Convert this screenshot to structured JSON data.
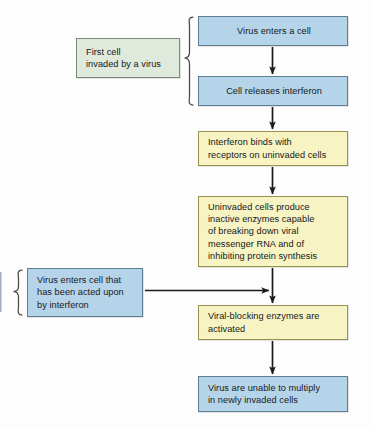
{
  "diagram": {
    "colors": {
      "blue_fill": "#b6d4e9",
      "blue_border": "#5d7d92",
      "yellow_fill": "#f7f3c2",
      "yellow_border": "#96914e",
      "green_fill": "#dfe9dc",
      "green_border": "#7b8a78",
      "arrow": "#1a1a1a",
      "background": "#fdfdfd"
    },
    "flow": [
      {
        "id": "virus-enters",
        "color": "blue",
        "align": "center",
        "lines": [
          "Virus enters a cell"
        ]
      },
      {
        "id": "cell-releases",
        "color": "blue",
        "align": "center",
        "lines": [
          "Cell releases interferon"
        ]
      },
      {
        "id": "interferon-binds",
        "color": "yellow",
        "align": "left",
        "lines": [
          "Interferon binds with",
          "receptors on uninvaded cells"
        ]
      },
      {
        "id": "uninvaded-cells",
        "color": "yellow",
        "align": "left",
        "lines": [
          "Uninvaded cells produce",
          "inactive enzymes capable",
          "of breaking down viral",
          "messenger RNA and of",
          "inhibiting protein synthesis"
        ]
      },
      {
        "id": "viral-blocking",
        "color": "yellow",
        "align": "left",
        "lines": [
          "Viral-blocking enzymes are",
          "activated"
        ]
      },
      {
        "id": "virus-unable",
        "color": "blue",
        "align": "left",
        "lines": [
          "Virus are unable to multiply",
          "in newly invaded cells"
        ]
      }
    ],
    "annotations": [
      {
        "id": "first-cell",
        "color": "green",
        "lines": [
          "First cell",
          "invaded by a virus"
        ],
        "connector": "brace-right"
      },
      {
        "id": "virus-enters-cell",
        "color": "blue",
        "lines": [
          "Virus enters cell that",
          "has been acted upon",
          "by interferon"
        ],
        "connector": "brace-left-and-arrow-right"
      }
    ],
    "connectors": [
      {
        "id": "arrow-1",
        "from": "virus-enters",
        "to": "cell-releases",
        "type": "arrow-down"
      },
      {
        "id": "arrow-2",
        "from": "cell-releases",
        "to": "interferon-binds",
        "type": "arrow-down"
      },
      {
        "id": "arrow-3",
        "from": "interferon-binds",
        "to": "uninvaded-cells",
        "type": "arrow-down"
      },
      {
        "id": "arrow-4",
        "from": "uninvaded-cells",
        "to": "viral-blocking",
        "type": "arrow-down"
      },
      {
        "id": "arrow-5",
        "from": "viral-blocking",
        "to": "virus-unable",
        "type": "arrow-down"
      },
      {
        "id": "arrow-6",
        "from": "virus-enters-cell",
        "to": "arrow-4",
        "type": "arrow-right"
      },
      {
        "id": "brace-1",
        "from": "first-cell",
        "to": "virus-enters,cell-releases",
        "type": "brace"
      },
      {
        "id": "brace-2",
        "from": "virus-enters-cell",
        "to": "left-edge",
        "type": "brace"
      }
    ]
  }
}
